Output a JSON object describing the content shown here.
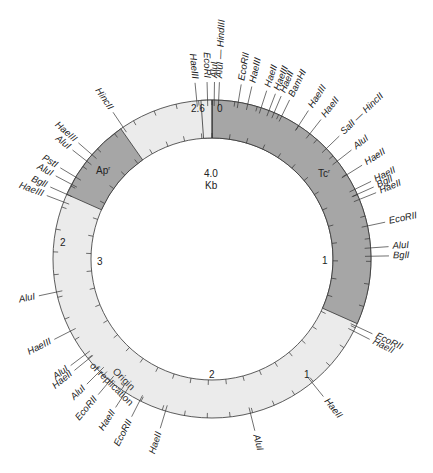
{
  "diagram": {
    "type": "plasmid-restriction-map",
    "center": {
      "label": "4.0",
      "unit": "Kb"
    },
    "total_length_kb": 4.36,
    "scale_labels": [
      {
        "text": "0",
        "kb": 0.0
      },
      {
        "text": "1",
        "kb": 1.0
      },
      {
        "text": "2",
        "kb": 2.0
      },
      {
        "text": "3",
        "kb": 3.0
      },
      {
        "text": "2.6",
        "kb": 2.6
      }
    ],
    "genes": [
      {
        "name": "Tc",
        "superscript": "r",
        "label": "Tc",
        "color": "#a6a6a6"
      },
      {
        "name": "Ap",
        "superscript": "r",
        "label": "Ap",
        "color": "#a6a6a6"
      }
    ],
    "origin": {
      "line1": "Origin",
      "line2": "of replication"
    },
    "colors": {
      "gene_region": "#a6a6a6",
      "backbone": "#ebebeb",
      "line": "#333333"
    },
    "sites": [
      {
        "label": "HaeIII",
        "angle": -5.5
      },
      {
        "label": "EcoRI",
        "angle": -1.6
      },
      {
        "label": "AluI",
        "angle": 0.8
      },
      {
        "label": "AluI — HindIII",
        "angle": 2.4
      },
      {
        "label": "EcoRII",
        "angle": 9.5
      },
      {
        "label": "HaeIII",
        "angle": 13
      },
      {
        "label": "HaeII",
        "angle": 18
      },
      {
        "label": "HaeIII",
        "angle": 21
      },
      {
        "label": "HaeII",
        "angle": 23
      },
      {
        "label": "BamHI",
        "angle": 26
      },
      {
        "label": "HaeIII",
        "angle": 33
      },
      {
        "label": "HaeII",
        "angle": 38
      },
      {
        "label": "SalI — HincII",
        "angle": 46
      },
      {
        "label": "AluI",
        "angle": 52
      },
      {
        "label": "HaeII",
        "angle": 58
      },
      {
        "label": "HaeII",
        "angle": 64
      },
      {
        "label": "BglI",
        "angle": 66
      },
      {
        "label": "HaeII",
        "angle": 68
      },
      {
        "label": "EcoRII",
        "angle": 78
      },
      {
        "label": "AluI",
        "angle": 86
      },
      {
        "label": "BglI",
        "angle": 89
      },
      {
        "label": "EcoRII",
        "angle": 115
      },
      {
        "label": "HaeII",
        "angle": 117
      },
      {
        "label": "HaeII",
        "angle": 141
      },
      {
        "label": "AluI",
        "angle": 166
      },
      {
        "label": "HaeII",
        "angle": 197
      },
      {
        "label": "EcoRII",
        "angle": 207
      },
      {
        "label": "HaeII",
        "angle": 213
      },
      {
        "label": "EcoRII",
        "angle": 220
      },
      {
        "label": "AluI",
        "angle": 225
      },
      {
        "label": "HaeII",
        "angle": 231
      },
      {
        "label": "AluI",
        "angle": 233
      },
      {
        "label": "HaeIII",
        "angle": 243
      },
      {
        "label": "AluI",
        "angle": 258
      },
      {
        "label": "HaeIII",
        "angle": 291
      },
      {
        "label": "BglI",
        "angle": 294
      },
      {
        "label": "AluI",
        "angle": 298
      },
      {
        "label": "PstI",
        "angle": 301
      },
      {
        "label": "AluI",
        "angle": 308
      },
      {
        "label": "HaeIII",
        "angle": 311
      },
      {
        "label": "HincII",
        "angle": 326
      }
    ]
  }
}
